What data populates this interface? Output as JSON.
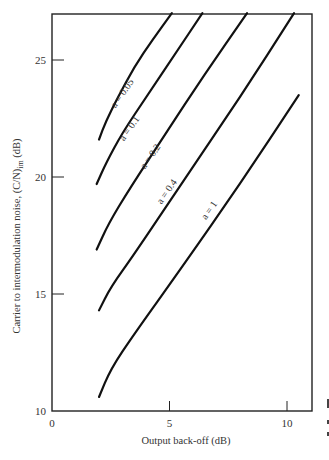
{
  "chart_data": {
    "type": "line",
    "title": "",
    "xlabel": "Output back-off (dB)",
    "ylabel": "Carrier to intermodulation noise, (C/N)im (dB)",
    "ylabel_main": "Carrier to intermodulation noise, (C/N)",
    "ylabel_sub": "im",
    "ylabel_unit": " (dB)",
    "xlim": [
      0,
      11
    ],
    "ylim": [
      10,
      27
    ],
    "xticks": [
      0,
      5,
      10
    ],
    "xtick_labels": [
      "0",
      "5",
      "10"
    ],
    "yticks": [
      10,
      15,
      20,
      25
    ],
    "ytick_labels": [
      "10",
      "15",
      "20",
      "25"
    ],
    "grid": false,
    "legend": "inline curve labels",
    "series": [
      {
        "name": "a = 0.05",
        "x": [
          2.0,
          2.3,
          2.8,
          3.5,
          4.3,
          5.1
        ],
        "y": [
          21.6,
          22.4,
          23.4,
          24.7,
          25.9,
          27.0
        ]
      },
      {
        "name": "a = 0.1",
        "x": [
          1.9,
          2.3,
          3.0,
          4.0,
          5.2,
          6.4
        ],
        "y": [
          19.7,
          20.6,
          21.9,
          23.4,
          25.2,
          27.0
        ]
      },
      {
        "name": "a = 0.2",
        "x": [
          1.9,
          2.4,
          3.3,
          4.8,
          6.5,
          8.3
        ],
        "y": [
          16.9,
          18.0,
          19.5,
          21.8,
          24.4,
          27.0
        ]
      },
      {
        "name": "a = 0.4",
        "x": [
          2.0,
          2.5,
          3.5,
          5.5,
          8.0,
          10.3
        ],
        "y": [
          14.3,
          15.3,
          16.7,
          19.7,
          23.4,
          27.0
        ]
      },
      {
        "name": "a = 1",
        "x": [
          2.0,
          2.5,
          3.5,
          5.5,
          8.0,
          10.5
        ],
        "y": [
          10.6,
          11.8,
          13.3,
          16.1,
          19.7,
          23.5
        ]
      }
    ]
  },
  "labels": [
    {
      "text": "a = 0.05",
      "x": 3.1,
      "y": 23.5,
      "angle": -55
    },
    {
      "text": "a = 0.1",
      "x": 3.4,
      "y": 22.0,
      "angle": -55
    },
    {
      "text": "a = 0.2",
      "x": 4.3,
      "y": 20.8,
      "angle": -55
    },
    {
      "text": "a = 0.4",
      "x": 5.0,
      "y": 19.3,
      "angle": -55
    },
    {
      "text": "a = 1",
      "x": 6.8,
      "y": 18.5,
      "angle": -55
    }
  ]
}
